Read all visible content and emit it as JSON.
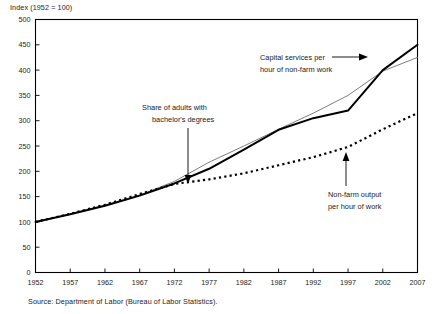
{
  "figure": {
    "axis_note": "Index (1952 = 100)",
    "source_note": "Source: Department of Labor (Bureau of Labor Statistics)."
  },
  "annotations": {
    "bachelors": {
      "line1": "Share of adults with",
      "line2": "bachelor's degrees"
    },
    "capital": {
      "line1": "Capital services per",
      "line2": "hour of non-farm work"
    },
    "output": {
      "line1": "Non-farm output",
      "line2": "per hour of work"
    }
  },
  "chart_data": {
    "type": "line",
    "title": "",
    "subtitle": "",
    "xlabel": "",
    "ylabel": "Index (1952 = 100)",
    "xlim": [
      1952,
      2007
    ],
    "ylim": [
      0,
      500
    ],
    "yticks": [
      0,
      50,
      100,
      150,
      200,
      250,
      300,
      350,
      400,
      450,
      500
    ],
    "xticks": [
      1952,
      1957,
      1962,
      1967,
      1972,
      1977,
      1982,
      1987,
      1992,
      1997,
      2002,
      2007
    ],
    "grid": false,
    "legend_position": "none (inline annotations with arrows)",
    "source": "Source: Department of Labor (Bureau of Labor Statistics).",
    "series": [
      {
        "name": "Capital services per hour of non-farm work",
        "style": "solid-bold-black",
        "color": "#000000",
        "x": [
          1952,
          1957,
          1962,
          1967,
          1972,
          1977,
          1982,
          1987,
          1992,
          1997,
          2002,
          2007
        ],
        "values": [
          100,
          115,
          132,
          152,
          176,
          205,
          243,
          282,
          305,
          320,
          400,
          450
        ]
      },
      {
        "name": "Share of adults with bachelor's degrees",
        "style": "solid-thin-gray",
        "color": "#6e6e6e",
        "x": [
          1952,
          1957,
          1962,
          1967,
          1972,
          1977,
          1982,
          1987,
          1992,
          1997,
          2002,
          2007
        ],
        "values": [
          100,
          116,
          133,
          153,
          180,
          218,
          250,
          283,
          315,
          350,
          398,
          425
        ]
      },
      {
        "name": "Non-farm output per hour of work",
        "style": "dotted-black",
        "color": "#000000",
        "x": [
          1952,
          1957,
          1962,
          1967,
          1972,
          1977,
          1982,
          1987,
          1992,
          1997,
          2002,
          2007
        ],
        "values": [
          100,
          116,
          134,
          155,
          175,
          184,
          196,
          212,
          228,
          248,
          283,
          315
        ]
      }
    ],
    "annotations": [
      {
        "text": "Share of adults with bachelor's degrees",
        "target_series": "Share of adults with bachelor's degrees",
        "arrow": "down"
      },
      {
        "text": "Capital services per hour of non-farm work",
        "target_series": "Capital services per hour of non-farm work",
        "arrow": "right"
      },
      {
        "text": "Non-farm output per hour of work",
        "target_series": "Non-farm output per hour of work",
        "arrow": "up"
      }
    ]
  }
}
